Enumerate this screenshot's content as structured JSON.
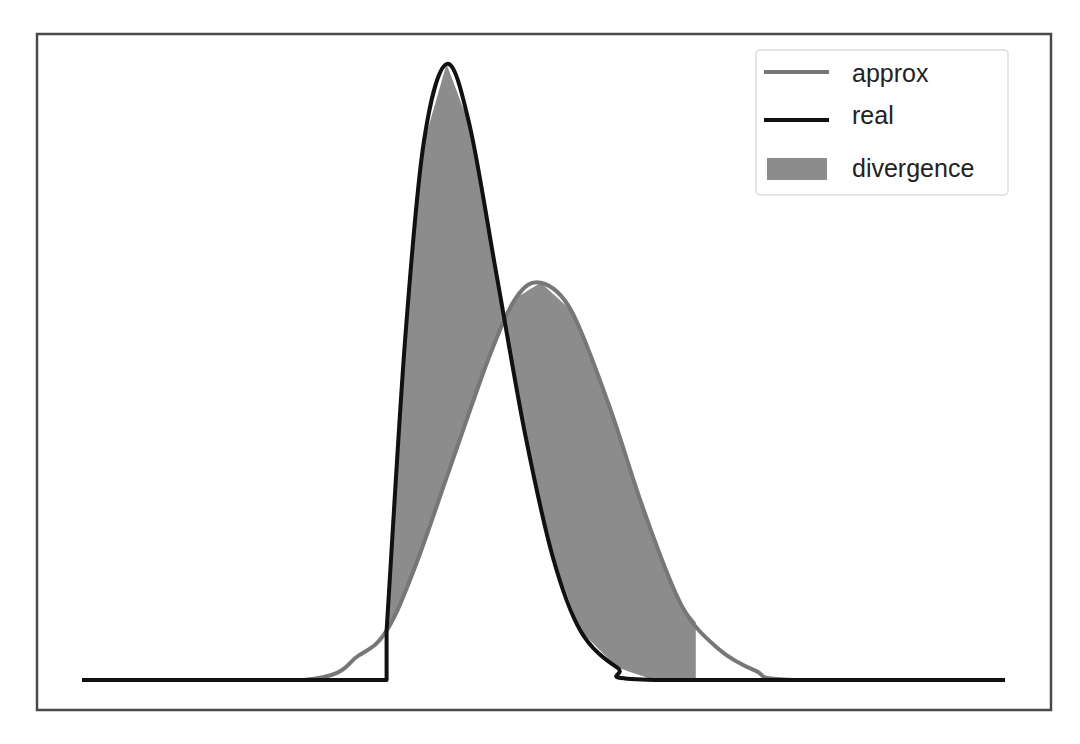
{
  "chart_data": {
    "type": "line",
    "title": "",
    "xlabel": "",
    "ylabel": "",
    "xlim": [
      0,
      10
    ],
    "ylim": [
      0,
      1
    ],
    "grid": false,
    "ticks_visible": false,
    "legend_position": "upper right",
    "legend": [
      {
        "label": "approx",
        "kind": "line",
        "color": "#777777"
      },
      {
        "label": "real",
        "kind": "line",
        "color": "#111111"
      },
      {
        "label": "divergence",
        "kind": "patch",
        "color": "#8c8c8c"
      }
    ],
    "series": [
      {
        "name": "real",
        "description": "zero until x=3.3, jumps and rises sharply to peak ~1.0 at x~3.95, decays to ~0 by x~6.2",
        "color": "#111111",
        "points": [
          [
            0,
            0
          ],
          [
            3.3,
            0
          ],
          [
            3.3,
            0.08
          ],
          [
            3.5,
            0.55
          ],
          [
            3.7,
            0.87
          ],
          [
            3.95,
            1.0
          ],
          [
            4.2,
            0.9
          ],
          [
            4.5,
            0.65
          ],
          [
            4.8,
            0.4
          ],
          [
            5.1,
            0.2
          ],
          [
            5.4,
            0.08
          ],
          [
            5.8,
            0.02
          ],
          [
            6.2,
            0.0
          ],
          [
            10,
            0
          ]
        ]
      },
      {
        "name": "approx",
        "description": "Gaussian-like, peak ~0.645 at x~4.97, roughly zero below x~2.4 and above x~7.7",
        "color": "#777777",
        "points": [
          [
            0,
            0
          ],
          [
            2.4,
            0
          ],
          [
            3.0,
            0.04
          ],
          [
            3.3,
            0.08
          ],
          [
            3.6,
            0.18
          ],
          [
            4.0,
            0.35
          ],
          [
            4.4,
            0.52
          ],
          [
            4.7,
            0.62
          ],
          [
            4.97,
            0.645
          ],
          [
            5.3,
            0.6
          ],
          [
            5.7,
            0.45
          ],
          [
            6.1,
            0.27
          ],
          [
            6.5,
            0.12
          ],
          [
            6.9,
            0.05
          ],
          [
            7.3,
            0.015
          ],
          [
            7.7,
            0
          ],
          [
            10,
            0
          ]
        ]
      }
    ],
    "fill_between": {
      "name": "divergence",
      "x_range": [
        3.3,
        6.65
      ],
      "between": [
        "real",
        "approx"
      ],
      "color": "#8c8c8c"
    }
  },
  "layout": {
    "frame": {
      "x": 36,
      "y": 33,
      "w": 1016,
      "h": 678
    },
    "plot": {
      "x0": 82,
      "x1": 1005,
      "y_base": 680,
      "y_top": 64
    }
  }
}
